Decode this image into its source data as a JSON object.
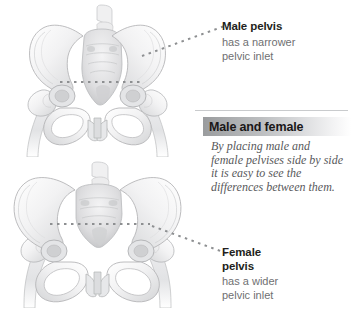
{
  "figure": {
    "background_color": "#ffffff"
  },
  "illustrations": [
    {
      "id": "male-pelvis-illustration",
      "name": "male-pelvis-drawing",
      "alt": "Anatomical grayscale drawing of a male pelvis seen from the front with femur heads",
      "inlet_marker": "dotted-line"
    },
    {
      "id": "female-pelvis-illustration",
      "name": "female-pelvis-drawing",
      "alt": "Anatomical grayscale drawing of a female pelvis seen from the front with femur heads",
      "inlet_marker": "dotted-line"
    }
  ],
  "callouts": {
    "male": {
      "title": "Male pelvis",
      "body_lines": [
        "has a narrower",
        "pelvic inlet"
      ],
      "title_color": "#231f20",
      "body_color": "#6f7072"
    },
    "female": {
      "title_lines": [
        "Female",
        "pelvis"
      ],
      "body_lines": [
        "has a wider",
        "pelvic inlet"
      ],
      "title_color": "#231f20",
      "body_color": "#6f7072"
    }
  },
  "middle": {
    "heading": "Male and female",
    "heading_color": "#1a1718",
    "band_color_start": "#9a9c9e",
    "band_color_end": "#ffffff",
    "rule_color": "#c9cbcd",
    "caption_lines": [
      "By placing male and",
      "female pelvises side by side",
      "it is easy to see the",
      "differences between them."
    ],
    "caption_color": "#58595b"
  },
  "leaders": {
    "male_label_line": "dotted-leader-line",
    "female_label_line": "dotted-leader-line",
    "dot_color": "#8d8f91"
  }
}
